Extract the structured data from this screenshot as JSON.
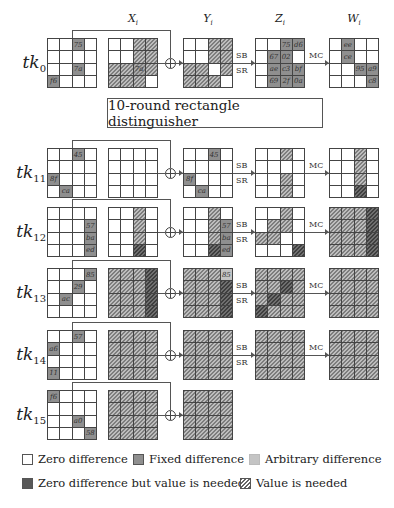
{
  "columns": [
    {
      "base": "X",
      "sub": "i",
      "x": 108
    },
    {
      "base": "Y",
      "sub": "i",
      "x": 183
    },
    {
      "base": "Z",
      "sub": "i",
      "x": 255
    },
    {
      "base": "W",
      "sub": "i",
      "x": 329
    }
  ],
  "distinguisher_label": "10-round rectangle distinguisher",
  "operations": {
    "sb": "SB",
    "sr": "SR",
    "mc": "MC"
  },
  "rows": [
    {
      "label": "tk",
      "sub": "0",
      "top": 38,
      "tk": [
        [
          "0",
          "0",
          "F:75",
          "0"
        ],
        [
          "0",
          "0",
          "0",
          "0"
        ],
        [
          "0",
          "0",
          "F:7a",
          "0"
        ],
        [
          "F:f6",
          "0",
          "0",
          "0"
        ]
      ],
      "x": [
        [
          "0",
          "0",
          "H",
          "H"
        ],
        [
          "0",
          "0",
          "H",
          "H"
        ],
        [
          "H",
          "H",
          "FH:7a",
          "H"
        ],
        [
          "H",
          "H",
          "H",
          "0"
        ]
      ],
      "y": [
        [
          "0",
          "0",
          "H",
          "H"
        ],
        [
          "0",
          "0",
          "H",
          "H"
        ],
        [
          "H",
          "H",
          "0",
          "H"
        ],
        [
          "H",
          "H",
          "H",
          "0"
        ]
      ],
      "z": [
        [
          "0",
          "0",
          "F:75",
          "F:d6"
        ],
        [
          "0",
          "F:67",
          "F:02",
          "0"
        ],
        [
          "0",
          "F:ae",
          "F:c3",
          "F:bf"
        ],
        [
          "0",
          "F:69",
          "F:2f",
          "F:0a"
        ]
      ],
      "w": [
        [
          "0",
          "F:ee",
          "0",
          "0"
        ],
        [
          "0",
          "F:ce",
          "0",
          "0"
        ],
        [
          "0",
          "0",
          "F:95",
          "F:a9"
        ],
        [
          "0",
          "0",
          "0",
          "F:c8"
        ]
      ],
      "has_mc": true
    },
    {
      "label": "tk",
      "sub": "11",
      "top": 148,
      "tk": [
        [
          "0",
          "0",
          "F:45",
          "0"
        ],
        [
          "0",
          "0",
          "0",
          "0"
        ],
        [
          "F:8f",
          "0",
          "0",
          "0"
        ],
        [
          "0",
          "F:ca",
          "0",
          "0"
        ]
      ],
      "x": [
        [
          "0",
          "0",
          "0",
          "0"
        ],
        [
          "0",
          "0",
          "0",
          "0"
        ],
        [
          "0",
          "0",
          "0",
          "0"
        ],
        [
          "0",
          "0",
          "0",
          "0"
        ]
      ],
      "y": [
        [
          "0",
          "0",
          "F:45",
          "0"
        ],
        [
          "0",
          "0",
          "0",
          "0"
        ],
        [
          "F:8f",
          "0",
          "0",
          "0"
        ],
        [
          "0",
          "F:ca",
          "0",
          "0"
        ]
      ],
      "z": [
        [
          "0",
          "0",
          "H",
          "0"
        ],
        [
          "0",
          "0",
          "0",
          "0"
        ],
        [
          "0",
          "0",
          "H",
          "0"
        ],
        [
          "0",
          "0",
          "H",
          "0"
        ]
      ],
      "w": [
        [
          "0",
          "0",
          "H",
          "0"
        ],
        [
          "0",
          "0",
          "H",
          "0"
        ],
        [
          "0",
          "0",
          "H",
          "0"
        ],
        [
          "0",
          "0",
          "DH",
          "0"
        ]
      ],
      "has_mc": true
    },
    {
      "label": "tk",
      "sub": "12",
      "top": 207,
      "tk": [
        [
          "0",
          "0",
          "0",
          "0"
        ],
        [
          "0",
          "0",
          "0",
          "F:57"
        ],
        [
          "0",
          "0",
          "0",
          "F:ba"
        ],
        [
          "0",
          "0",
          "0",
          "F:ed"
        ]
      ],
      "x": [
        [
          "0",
          "0",
          "H",
          "0"
        ],
        [
          "0",
          "0",
          "H",
          "0"
        ],
        [
          "0",
          "0",
          "H",
          "0"
        ],
        [
          "0",
          "0",
          "DH",
          "0"
        ]
      ],
      "y": [
        [
          "0",
          "0",
          "H",
          "0"
        ],
        [
          "0",
          "0",
          "H",
          "F:57"
        ],
        [
          "0",
          "0",
          "H",
          "F:ba"
        ],
        [
          "0",
          "0",
          "DH",
          "F:ed"
        ]
      ],
      "z": [
        [
          "0",
          "0",
          "H",
          "0"
        ],
        [
          "0",
          "H",
          "H",
          "0"
        ],
        [
          "H",
          "H",
          "0",
          "0"
        ],
        [
          "0",
          "0",
          "0",
          "DH"
        ]
      ],
      "w": [
        [
          "H",
          "H",
          "H",
          "DH"
        ],
        [
          "H",
          "H",
          "H",
          "DH"
        ],
        [
          "H",
          "H",
          "H",
          "DH"
        ],
        [
          "H",
          "H",
          "H",
          "DH"
        ]
      ],
      "has_mc": true
    },
    {
      "label": "tk",
      "sub": "13",
      "top": 268,
      "tk": [
        [
          "0",
          "0",
          "0",
          "F:85"
        ],
        [
          "0",
          "0",
          "F:29",
          "0"
        ],
        [
          "0",
          "F:ac",
          "0",
          "0"
        ],
        [
          "0",
          "0",
          "0",
          "0"
        ]
      ],
      "x": [
        [
          "H",
          "H",
          "H",
          "DH"
        ],
        [
          "H",
          "H",
          "H",
          "DH"
        ],
        [
          "H",
          "H",
          "H",
          "DH"
        ],
        [
          "H",
          "H",
          "H",
          "DH"
        ]
      ],
      "y": [
        [
          "H",
          "H",
          "H",
          "A:85"
        ],
        [
          "H",
          "H",
          "H",
          "DH"
        ],
        [
          "H",
          "H",
          "H",
          "DH"
        ],
        [
          "H",
          "H",
          "H",
          "DH"
        ]
      ],
      "z": [
        [
          "H",
          "H",
          "H",
          "H"
        ],
        [
          "H",
          "H",
          "DH",
          "H"
        ],
        [
          "H",
          "DH",
          "H",
          "H"
        ],
        [
          "DH",
          "H",
          "H",
          "H"
        ]
      ],
      "w": [
        [
          "H",
          "H",
          "H",
          "H"
        ],
        [
          "H",
          "H",
          "H",
          "H"
        ],
        [
          "H",
          "H",
          "H",
          "H"
        ],
        [
          "H",
          "H",
          "H",
          "H"
        ]
      ],
      "has_mc": true
    },
    {
      "label": "tk",
      "sub": "14",
      "top": 330,
      "tk": [
        [
          "0",
          "0",
          "F:57",
          "0"
        ],
        [
          "F:a6",
          "0",
          "0",
          "0"
        ],
        [
          "0",
          "0",
          "0",
          "0"
        ],
        [
          "F:11",
          "0",
          "0",
          "0"
        ]
      ],
      "x": [
        [
          "H",
          "H",
          "H",
          "H"
        ],
        [
          "H",
          "H",
          "H",
          "H"
        ],
        [
          "H",
          "H",
          "H",
          "H"
        ],
        [
          "H",
          "H",
          "H",
          "H"
        ]
      ],
      "y": [
        [
          "H",
          "H",
          "H",
          "H"
        ],
        [
          "H",
          "H",
          "H",
          "H"
        ],
        [
          "H",
          "H",
          "H",
          "H"
        ],
        [
          "H",
          "H",
          "H",
          "H"
        ]
      ],
      "z": [
        [
          "H",
          "H",
          "H",
          "H"
        ],
        [
          "H",
          "H",
          "H",
          "H"
        ],
        [
          "H",
          "H",
          "H",
          "H"
        ],
        [
          "H",
          "H",
          "H",
          "H"
        ]
      ],
      "w": [
        [
          "H",
          "H",
          "H",
          "H"
        ],
        [
          "H",
          "H",
          "H",
          "H"
        ],
        [
          "H",
          "H",
          "H",
          "H"
        ],
        [
          "H",
          "H",
          "H",
          "H"
        ]
      ],
      "has_mc": true
    },
    {
      "label": "tk",
      "sub": "15",
      "top": 390,
      "tk": [
        [
          "F:f6",
          "0",
          "0",
          "0"
        ],
        [
          "0",
          "0",
          "0",
          "0"
        ],
        [
          "0",
          "0",
          "F:a0",
          "0"
        ],
        [
          "0",
          "0",
          "0",
          "F:58"
        ]
      ],
      "x": [
        [
          "H",
          "H",
          "H",
          "H"
        ],
        [
          "H",
          "H",
          "H",
          "H"
        ],
        [
          "H",
          "H",
          "H",
          "H"
        ],
        [
          "H",
          "H",
          "H",
          "H"
        ]
      ],
      "y": [
        [
          "H",
          "H",
          "H",
          "H"
        ],
        [
          "H",
          "H",
          "H",
          "H"
        ],
        [
          "H",
          "H",
          "H",
          "H"
        ],
        [
          "H",
          "H",
          "H",
          "H"
        ]
      ],
      "z": null,
      "w": null,
      "has_mc": false
    }
  ],
  "legend": [
    {
      "key": "zero",
      "label": "Zero difference",
      "swatch": "#ffffff"
    },
    {
      "key": "fixed",
      "label": "Fixed difference",
      "swatch": "#8f8f8f"
    },
    {
      "key": "arbitrary",
      "label": "Arbitrary difference",
      "swatch": "#c4c4c4"
    },
    {
      "key": "zero-value-needed",
      "label": "Zero difference but value is needed",
      "swatch": "#585858"
    },
    {
      "key": "value-needed",
      "label": "Value is needed",
      "swatch": "hatched"
    }
  ]
}
